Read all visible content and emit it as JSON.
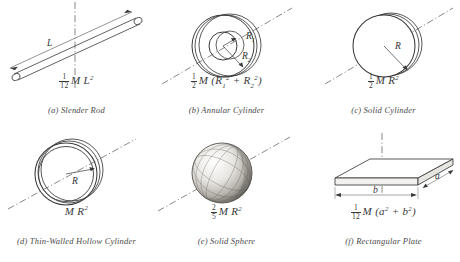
{
  "figure": {
    "background": "#ffffff",
    "ink": "#2b2b2b",
    "axis_style": "dash-dot"
  },
  "items": [
    {
      "key": "slender-rod",
      "letter": "(a)",
      "caption": "(a)  Slender Rod",
      "name": "Slender Rod",
      "formula_numer": "1",
      "formula_denom": "12",
      "formula_body": "M L",
      "formula_exp": "2",
      "formula_plain": "1/12 M L²",
      "dimension_labels": [
        "L"
      ]
    },
    {
      "key": "annular-cylinder",
      "letter": "(b)",
      "caption": "(b)  Annular Cylinder",
      "name": "Annular Cylinder",
      "formula_numer": "1",
      "formula_denom": "2",
      "formula_body": "M",
      "formula_plain": "1/2 M (R₁² + R₂²)",
      "dimension_labels": [
        "R",
        "1",
        "R",
        "2"
      ],
      "radius_inner_label": "R",
      "radius_inner_sub": "1",
      "radius_outer_label": "R",
      "radius_outer_sub": "2"
    },
    {
      "key": "solid-cylinder",
      "letter": "(c)",
      "caption": "(c)  Solid Cylinder",
      "name": "Solid Cylinder",
      "formula_numer": "1",
      "formula_denom": "2",
      "formula_body": "M R",
      "formula_exp": "2",
      "formula_plain": "1/2 M R²",
      "dimension_labels": [
        "R"
      ]
    },
    {
      "key": "thin-walled-hollow-cylinder",
      "letter": "(d)",
      "caption": "(d)  Thin-Walled Hollow Cylinder",
      "name": "Thin-Walled Hollow Cylinder",
      "formula_body": "M R",
      "formula_exp": "2",
      "formula_plain": "M R²",
      "dimension_labels": [
        "R"
      ]
    },
    {
      "key": "solid-sphere",
      "letter": "(e)",
      "caption": "(e)  Solid Sphere",
      "name": "Solid Sphere",
      "formula_numer": "2",
      "formula_denom": "5",
      "formula_body": "M R",
      "formula_exp": "2",
      "formula_plain": "2/5 M R²",
      "dimension_labels": []
    },
    {
      "key": "rectangular-plate",
      "letter": "(f)",
      "caption": "(f)  Rectangular Plate",
      "name": "Rectangular Plate",
      "formula_numer": "1",
      "formula_denom": "12",
      "formula_body": "M",
      "formula_plain": "1/12 M (a² + b²)",
      "dimension_labels": [
        "a",
        "b"
      ],
      "side_a_label": "a",
      "side_b_label": "b"
    }
  ],
  "symbols": {
    "open_paren": "(",
    "close_paren": ")",
    "plus": "+",
    "a": "a",
    "b": "b",
    "R": "R",
    "L": "L",
    "sq": "2",
    "sub1": "1",
    "sub2": "2"
  }
}
